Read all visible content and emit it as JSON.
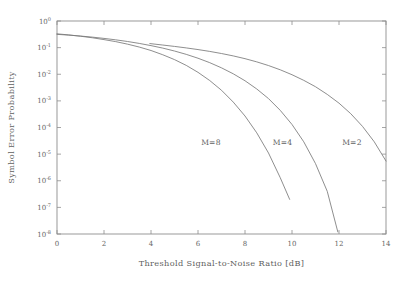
{
  "chart_data": {
    "type": "line",
    "title": "",
    "xlabel": "Threshold Signal-to-Noise Ratio [dB]",
    "ylabel": "Symbol Error Probability",
    "xlim": [
      0,
      14
    ],
    "ylim": [
      1e-08,
      1
    ],
    "yscale": "log",
    "xscale": "linear",
    "grid": false,
    "legend_position": "inline-annotations",
    "xticks": [
      0,
      2,
      4,
      6,
      8,
      10,
      12,
      14
    ],
    "xtick_labels": [
      "0",
      "2",
      "4",
      "6",
      "8",
      "10",
      "12",
      "14"
    ],
    "yticks": [
      1,
      0.1,
      0.01,
      0.001,
      0.0001,
      1e-05,
      1e-06,
      1e-07,
      1e-08
    ],
    "ytick_labels": [
      {
        "base": "10",
        "exp": "0"
      },
      {
        "base": "10",
        "exp": "-1"
      },
      {
        "base": "10",
        "exp": "-2"
      },
      {
        "base": "10",
        "exp": "-3"
      },
      {
        "base": "10",
        "exp": "-4"
      },
      {
        "base": "10",
        "exp": "-5"
      },
      {
        "base": "10",
        "exp": "-6"
      },
      {
        "base": "10",
        "exp": "-7"
      },
      {
        "base": "10",
        "exp": "-8"
      }
    ],
    "series": [
      {
        "name": "M=8",
        "label": "M=8",
        "label_x": 6.55,
        "label_y": 2.2e-05,
        "color": "#7a7a7a",
        "x": [
          0.0,
          0.5,
          1.0,
          1.5,
          2.0,
          2.5,
          3.0,
          3.5,
          4.0,
          4.5,
          5.0,
          5.5,
          6.0,
          6.5,
          7.0,
          7.5,
          8.0,
          8.5,
          9.0,
          9.5,
          9.9
        ],
        "y": [
          0.33,
          0.3,
          0.268,
          0.235,
          0.2,
          0.168,
          0.135,
          0.105,
          0.078,
          0.054,
          0.0355,
          0.0215,
          0.0118,
          0.0058,
          0.0025,
          0.0009,
          0.00027,
          6.3e-05,
          1.1e-05,
          1.3e-06,
          2e-07
        ]
      },
      {
        "name": "M=4",
        "label": "M=4",
        "label_x": 9.6,
        "label_y": 2.2e-05,
        "color": "#7a7a7a",
        "x": [
          0.0,
          0.5,
          1.0,
          1.5,
          2.0,
          2.5,
          3.0,
          3.5,
          4.0,
          4.5,
          5.0,
          5.5,
          6.0,
          6.5,
          7.0,
          7.5,
          8.0,
          8.5,
          9.0,
          9.5,
          10.0,
          10.5,
          11.0,
          11.5,
          11.95
        ],
        "y": [
          0.315,
          0.295,
          0.272,
          0.248,
          0.222,
          0.196,
          0.17,
          0.144,
          0.119,
          0.096,
          0.0745,
          0.0558,
          0.04,
          0.0272,
          0.0174,
          0.0104,
          0.0057,
          0.0028,
          0.00122,
          0.00044,
          0.00013,
          2.9e-05,
          4.4e-06,
          4e-07,
          1.2e-08
        ]
      },
      {
        "name": "M=2",
        "label": "M=2",
        "label_x": 12.55,
        "label_y": 2.2e-05,
        "color": "#7a7a7a",
        "x": [
          3.95,
          4.5,
          5.0,
          5.5,
          6.0,
          6.5,
          7.0,
          7.5,
          8.0,
          8.5,
          9.0,
          9.5,
          10.0,
          10.5,
          11.0,
          11.5,
          12.0,
          12.5,
          13.0,
          13.5,
          14.0
        ],
        "y": [
          0.142,
          0.125,
          0.111,
          0.0975,
          0.0845,
          0.072,
          0.06,
          0.0488,
          0.0385,
          0.0292,
          0.0212,
          0.0147,
          0.0096,
          0.0059,
          0.0034,
          0.00175,
          0.00082,
          0.00033,
          0.00011,
          2.9e-05,
          5.5e-06
        ]
      }
    ]
  },
  "axis_titles": {
    "x": "Threshold Signal-to-Noise Ratio [dB]",
    "y": "Symbol Error Probability"
  }
}
